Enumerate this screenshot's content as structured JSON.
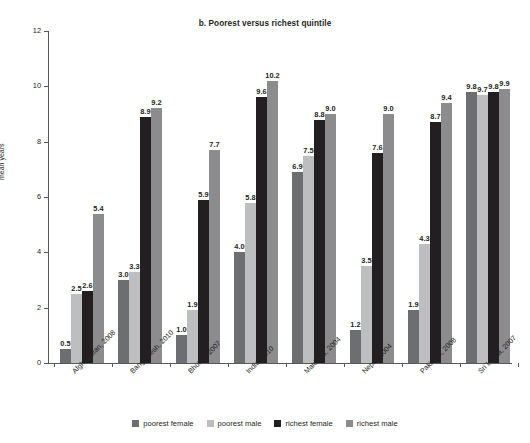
{
  "chart_data": {
    "type": "bar",
    "title": "b. Poorest versus richest quintile",
    "xlabel": "",
    "ylabel": "mean years",
    "ylim": [
      0,
      12
    ],
    "yticks": [
      0,
      2,
      4,
      6,
      8,
      10,
      12
    ],
    "grid": false,
    "legend_position": "bottom",
    "categories": [
      "Afghanistan, 2008",
      "Bangladesh, 2010",
      "Bhutan, 2007",
      "India, 2010",
      "Maldives, 2004",
      "Nepal, 2004",
      "Pakistan, 2008",
      "Sri Lanka, 2007"
    ],
    "series": [
      {
        "name": "poorest female",
        "color": "#6d6e71",
        "values": [
          0.5,
          3.0,
          1.0,
          4.0,
          6.9,
          1.2,
          1.9,
          9.8
        ],
        "labels": [
          "0.5",
          "3.0",
          "1.0",
          "4.0",
          "6.9",
          "1.2",
          "1.9",
          "9.8"
        ]
      },
      {
        "name": "poorest male",
        "color": "#bcbec0",
        "values": [
          2.5,
          3.3,
          1.9,
          5.8,
          7.5,
          3.5,
          4.3,
          9.7
        ],
        "labels": [
          "2.5",
          "3.3",
          "1.9",
          "5.8",
          "7.5",
          "3.5",
          "4.3",
          "9.7"
        ]
      },
      {
        "name": "richest female",
        "color": "#231f20",
        "values": [
          2.6,
          8.9,
          5.9,
          9.6,
          8.8,
          7.6,
          8.7,
          9.8
        ],
        "labels": [
          "2.6",
          "8.9",
          "5.9",
          "9.6",
          "8.8",
          "7.6",
          "8.7",
          "9.8"
        ]
      },
      {
        "name": "richest male",
        "color": "#8c8c8e",
        "values": [
          5.4,
          9.2,
          7.7,
          10.2,
          9.0,
          9.0,
          9.4,
          9.9
        ],
        "labels": [
          "5.4",
          "9.2",
          "7.7",
          "10.2",
          "9.0",
          "9.0",
          "9.4",
          "9.9"
        ]
      }
    ]
  },
  "axis": {
    "y_title": "mean years",
    "y_tick_labels": [
      "0",
      "2",
      "4",
      "6",
      "8",
      "10",
      "12"
    ]
  },
  "legend": {
    "items": [
      {
        "label": "poorest female",
        "color": "#6d6e71"
      },
      {
        "label": "poorest male",
        "color": "#bcbec0"
      },
      {
        "label": "richest female",
        "color": "#231f20"
      },
      {
        "label": "richest male",
        "color": "#8c8c8e"
      }
    ]
  }
}
